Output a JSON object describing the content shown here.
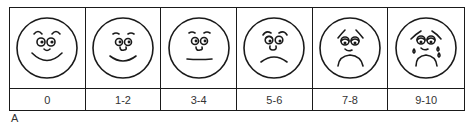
{
  "figure_label": "A",
  "faces": [
    {
      "label": "0",
      "expression": "very-happy-face-icon"
    },
    {
      "label": "1-2",
      "expression": "happy-face-icon"
    },
    {
      "label": "3-4",
      "expression": "neutral-face-icon"
    },
    {
      "label": "5-6",
      "expression": "sad-face-icon"
    },
    {
      "label": "7-8",
      "expression": "very-sad-face-icon"
    },
    {
      "label": "9-10",
      "expression": "crying-face-icon"
    }
  ],
  "colors": {
    "stroke": "#1a1a1a",
    "background": "#ffffff"
  }
}
